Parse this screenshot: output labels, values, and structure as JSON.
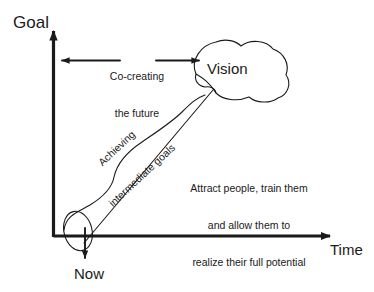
{
  "diagram": {
    "title_text": "Vision, goals and time diagram",
    "axes": {
      "y_label": "Goal",
      "x_label": "Time"
    },
    "origin_label": "Now",
    "vision_label": "Vision",
    "span_arrow_label_line1": "Co-creating",
    "span_arrow_label_line2": "the future",
    "diagonal_label_line1": "Achieving",
    "diagonal_label_line2": "intermediate goals",
    "note_line1": "Attract people, train them",
    "note_line2": "and allow them to",
    "note_line3": "realize their full potential",
    "colors": {
      "ink": "#1a1a1a",
      "background": "#ffffff"
    },
    "icons": {
      "y_axis": "up-arrow-icon",
      "x_axis": "right-arrow-icon",
      "span": "double-headed-arrow-icon",
      "now": "down-arrow-icon",
      "vision": "cloud-shape-icon",
      "origin": "ellipse-highlight-icon",
      "path": "diagonal-growth-line-icon",
      "wave": "wavy-progress-curve-icon"
    }
  }
}
